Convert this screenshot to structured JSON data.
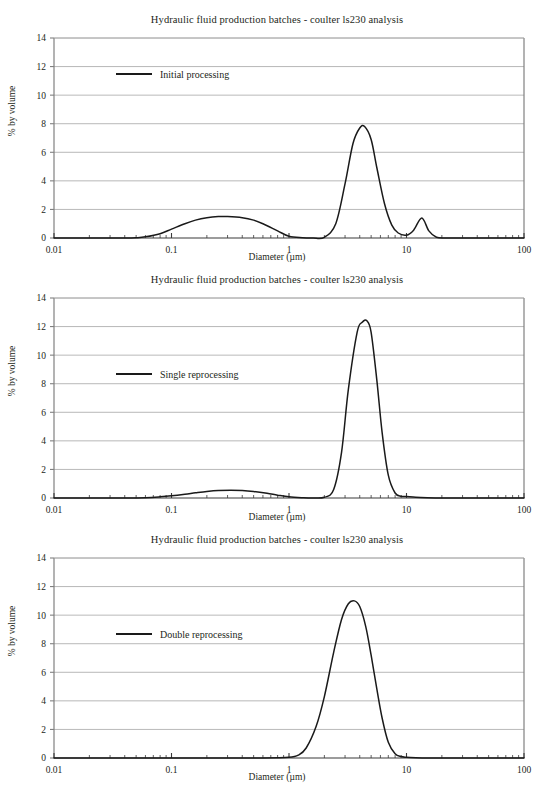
{
  "figure": {
    "width": 554,
    "height": 807,
    "background": "#ffffff",
    "line_color": "#1a1a1a",
    "grid_color": "#a6a6a6",
    "axis_color": "#808080",
    "text_color": "#231f20"
  },
  "common": {
    "title": "Hydraulic fluid production batches - coulter ls230 analysis",
    "xlabel": "Diameter (µm)",
    "ylabel": "% by volume",
    "x_tick_labels": [
      "0.01",
      "0.1",
      "1",
      "10",
      "100"
    ],
    "y_tick_labels": [
      "0",
      "2",
      "4",
      "6",
      "8",
      "10",
      "12",
      "14"
    ]
  },
  "chart_data": [
    {
      "type": "line",
      "title": "Hydraulic fluid production batches - coulter ls230 analysis",
      "xlabel": "Diameter (µm)",
      "ylabel": "% by volume",
      "xscale": "log",
      "xlim": [
        0.01,
        100
      ],
      "ylim": [
        0,
        14
      ],
      "xticks": [
        0.01,
        0.1,
        1,
        10,
        100
      ],
      "yticks": [
        0,
        2,
        4,
        6,
        8,
        10,
        12,
        14
      ],
      "grid": "horizontal",
      "legend": {
        "position": "upper-left-inside",
        "entries": [
          "Initial processing"
        ]
      },
      "series": [
        {
          "name": "Initial processing",
          "color": "#1a1a1a",
          "peaks": [
            {
              "center_um": 0.3,
              "height_pct": 1.5,
              "log_sigma": 0.34
            },
            {
              "center_um": 4.4,
              "height_pct": 7.8,
              "log_sigma": 0.105
            },
            {
              "center_um": 13.5,
              "height_pct": 1.4,
              "log_sigma": 0.052
            }
          ],
          "x": [
            0.01,
            0.02,
            0.03,
            0.04,
            0.05,
            0.06,
            0.08,
            0.1,
            0.13,
            0.16,
            0.2,
            0.25,
            0.3,
            0.4,
            0.5,
            0.6,
            0.8,
            1.0,
            1.3,
            1.6,
            2.0,
            2.5,
            3.0,
            3.5,
            4.0,
            4.4,
            5.0,
            5.6,
            6.5,
            7.5,
            8.5,
            10.0,
            11.5,
            13.5,
            15.5,
            18.0,
            22.0,
            30.0,
            50.0,
            100.0
          ],
          "y": [
            0.0,
            0.0,
            0.0,
            0.0,
            0.02,
            0.08,
            0.3,
            0.62,
            1.0,
            1.25,
            1.42,
            1.5,
            1.5,
            1.42,
            1.25,
            1.0,
            0.5,
            0.12,
            0.02,
            0.0,
            0.05,
            1.0,
            3.8,
            6.6,
            7.7,
            7.8,
            6.9,
            4.9,
            2.4,
            0.9,
            0.35,
            0.2,
            0.55,
            1.4,
            0.5,
            0.05,
            0.0,
            0.0,
            0.0,
            0.0
          ]
        }
      ]
    },
    {
      "type": "line",
      "title": "Hydraulic fluid production batches - coulter ls230 analysis",
      "xlabel": "Diameter (µm)",
      "ylabel": "% by volume",
      "xscale": "log",
      "xlim": [
        0.01,
        100
      ],
      "ylim": [
        0,
        14
      ],
      "xticks": [
        0.01,
        0.1,
        1,
        10,
        100
      ],
      "yticks": [
        0,
        2,
        4,
        6,
        8,
        10,
        12,
        14
      ],
      "grid": "horizontal",
      "legend": {
        "position": "left-inside-mid",
        "entries": [
          "Single reprocessing"
        ]
      },
      "series": [
        {
          "name": "Single reprocessing",
          "color": "#1a1a1a",
          "peaks": [
            {
              "center_um": 0.32,
              "height_pct": 0.55,
              "log_sigma": 0.33
            },
            {
              "center_um": 4.6,
              "height_pct": 12.4,
              "log_sigma": 0.098
            }
          ],
          "x": [
            0.01,
            0.02,
            0.04,
            0.06,
            0.08,
            0.1,
            0.13,
            0.16,
            0.2,
            0.25,
            0.32,
            0.4,
            0.5,
            0.65,
            0.8,
            1.0,
            1.3,
            1.6,
            2.0,
            2.4,
            2.8,
            3.2,
            3.8,
            4.2,
            4.6,
            5.0,
            5.6,
            6.2,
            7.0,
            8.0,
            9.0,
            10.0,
            12.0,
            15.0,
            20.0,
            30.0,
            50.0,
            100.0
          ],
          "y": [
            0.0,
            0.0,
            0.0,
            0.02,
            0.08,
            0.15,
            0.26,
            0.36,
            0.46,
            0.53,
            0.55,
            0.53,
            0.46,
            0.33,
            0.2,
            0.08,
            0.02,
            0.0,
            0.05,
            0.6,
            3.2,
            7.6,
            11.6,
            12.3,
            12.4,
            11.6,
            8.2,
            4.6,
            1.6,
            0.35,
            0.12,
            0.1,
            0.05,
            0.02,
            0.0,
            0.0,
            0.0,
            0.0
          ]
        }
      ]
    },
    {
      "type": "line",
      "title": "Hydraulic fluid production batches - coulter ls230 analysis",
      "xlabel": "Diameter (µm)",
      "ylabel": "% by volume",
      "xscale": "log",
      "xlim": [
        0.01,
        100
      ],
      "ylim": [
        0,
        14
      ],
      "xticks": [
        0.01,
        0.1,
        1,
        10,
        100
      ],
      "yticks": [
        0,
        2,
        4,
        6,
        8,
        10,
        12,
        14
      ],
      "grid": "horizontal",
      "legend": {
        "position": "left-inside-mid",
        "entries": [
          "Double reprocessing"
        ]
      },
      "series": [
        {
          "name": "Double reprocessing",
          "color": "#1a1a1a",
          "peaks": [
            {
              "center_um": 3.6,
              "height_pct": 11.0,
              "log_sigma": 0.118
            }
          ],
          "x": [
            0.01,
            0.05,
            0.1,
            0.3,
            0.6,
            1.0,
            1.2,
            1.4,
            1.7,
            2.0,
            2.4,
            2.8,
            3.2,
            3.6,
            4.0,
            4.5,
            5.0,
            5.6,
            6.2,
            7.0,
            8.0,
            9.0,
            10.0,
            12.0,
            15.0,
            20.0,
            30.0,
            50.0,
            100.0
          ],
          "y": [
            0.0,
            0.0,
            0.0,
            0.0,
            0.0,
            0.05,
            0.2,
            0.7,
            2.2,
            4.3,
            7.4,
            9.7,
            10.8,
            11.0,
            10.6,
            9.2,
            7.2,
            4.8,
            2.8,
            1.1,
            0.3,
            0.1,
            0.05,
            0.02,
            0.0,
            0.0,
            0.0,
            0.0,
            0.0
          ]
        }
      ]
    }
  ]
}
